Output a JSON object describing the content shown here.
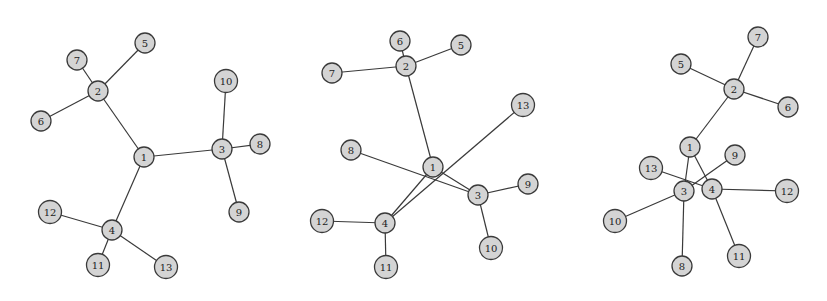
{
  "graphs": [
    {
      "name": "graph-1",
      "nodes": [
        "1",
        "2",
        "3",
        "4",
        "5",
        "6",
        "7",
        "8",
        "9",
        "10",
        "11",
        "12",
        "13"
      ],
      "edges": [
        [
          "1",
          "2"
        ],
        [
          "1",
          "3"
        ],
        [
          "1",
          "4"
        ],
        [
          "2",
          "5"
        ],
        [
          "2",
          "6"
        ],
        [
          "2",
          "7"
        ],
        [
          "3",
          "8"
        ],
        [
          "3",
          "9"
        ],
        [
          "3",
          "10"
        ],
        [
          "4",
          "11"
        ],
        [
          "4",
          "12"
        ],
        [
          "4",
          "13"
        ]
      ]
    },
    {
      "name": "graph-2",
      "nodes": [
        "1",
        "2",
        "3",
        "4",
        "5",
        "6",
        "7",
        "8",
        "9",
        "10",
        "11",
        "12",
        "13"
      ],
      "edges": [
        [
          "1",
          "2"
        ],
        [
          "1",
          "3"
        ],
        [
          "1",
          "4"
        ],
        [
          "2",
          "5"
        ],
        [
          "2",
          "6"
        ],
        [
          "2",
          "7"
        ],
        [
          "3",
          "8"
        ],
        [
          "3",
          "9"
        ],
        [
          "3",
          "10"
        ],
        [
          "4",
          "11"
        ],
        [
          "4",
          "12"
        ],
        [
          "4",
          "13"
        ]
      ]
    },
    {
      "name": "graph-3",
      "nodes": [
        "1",
        "2",
        "3",
        "4",
        "5",
        "6",
        "7",
        "8",
        "9",
        "10",
        "11",
        "12",
        "13"
      ],
      "edges": [
        [
          "1",
          "2"
        ],
        [
          "1",
          "3"
        ],
        [
          "1",
          "4"
        ],
        [
          "2",
          "5"
        ],
        [
          "2",
          "6"
        ],
        [
          "2",
          "7"
        ],
        [
          "3",
          "8"
        ],
        [
          "3",
          "9"
        ],
        [
          "3",
          "10"
        ],
        [
          "4",
          "11"
        ],
        [
          "4",
          "12"
        ],
        [
          "4",
          "13"
        ]
      ]
    }
  ]
}
